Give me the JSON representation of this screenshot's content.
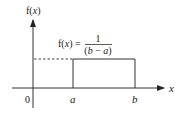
{
  "diagram": {
    "y_axis_label": "f(x)",
    "x_axis_label": "x",
    "origin_label": "0",
    "a_label": "a",
    "b_label": "b",
    "formula": {
      "lhs": "f(x) =",
      "numerator": "1",
      "denominator": "(b − a)"
    },
    "colors": {
      "line": "#333333",
      "text": "#222222"
    }
  }
}
